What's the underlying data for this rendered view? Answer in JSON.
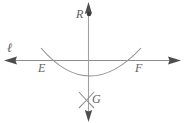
{
  "figure": {
    "colors": {
      "stroke": "#8d8d8d",
      "stroke_dark": "#6e6e6e",
      "label": "#5f5f5f",
      "background": "#ffffff"
    },
    "labels": {
      "line_l": "ℓ",
      "point_R": "R",
      "point_E": "E",
      "point_F": "F",
      "point_G": "G"
    },
    "elements": [
      {
        "name": "line-l-horizontal",
        "type": "double-arrow-line",
        "x1": 6,
        "y1": 60,
        "x2": 179,
        "y2": 60
      },
      {
        "name": "line-vertical-through-R-G",
        "type": "double-arrow-line",
        "x1": 88,
        "y1": 4,
        "x2": 88,
        "y2": 120
      },
      {
        "name": "arc-through-E-F",
        "type": "arc",
        "start_x": 42,
        "start_y": 50,
        "end_x": 140,
        "end_y": 50,
        "lowest_y": 79
      },
      {
        "name": "arc-cross-left-at-G",
        "type": "arc-segment"
      },
      {
        "name": "arc-cross-right-at-G",
        "type": "arc-segment"
      },
      {
        "name": "point-R-dot",
        "type": "dot",
        "x": 89,
        "y": 14
      },
      {
        "name": "point-E",
        "type": "intersection",
        "x": 45,
        "y": 60
      },
      {
        "name": "point-F",
        "type": "intersection",
        "x": 137,
        "y": 60
      },
      {
        "name": "point-G",
        "type": "intersection",
        "x": 87,
        "y": 100
      }
    ]
  }
}
